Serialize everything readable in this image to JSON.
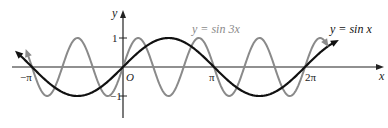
{
  "chart_data": {
    "type": "line",
    "title": "",
    "xlabel": "x",
    "ylabel": "y",
    "origin_label": "O",
    "x_ticks": [
      {
        "label": "−π",
        "value": -3.14159
      },
      {
        "label": "π",
        "value": 3.14159
      },
      {
        "label": "2π",
        "value": 6.28319
      }
    ],
    "y_ticks": [
      {
        "label": "1",
        "value": 1
      },
      {
        "label": "−1",
        "value": -1
      }
    ],
    "xlim": [
      -3.6,
      7.2
    ],
    "ylim": [
      -1.6,
      1.6
    ],
    "grid": false,
    "series": [
      {
        "name": "y = sin 3x",
        "function": "sin(3x)",
        "color": "#8a8a8a",
        "x_range": [
          -3.3,
          7.0
        ]
      },
      {
        "name": "y = sin x",
        "function": "sin(x)",
        "color": "#111111",
        "x_range": [
          -3.6,
          7.3
        ]
      }
    ],
    "annotations": [
      {
        "text": "y = sin 3x",
        "color": "#8a8a8a"
      },
      {
        "text": "y = sin x",
        "color": "#111111"
      }
    ]
  }
}
